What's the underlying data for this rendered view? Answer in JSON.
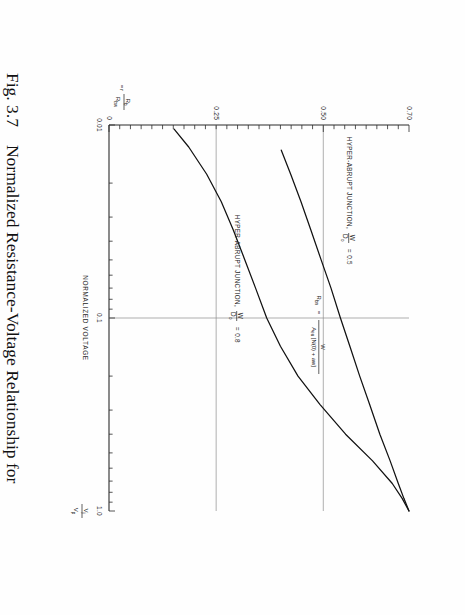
{
  "figure": {
    "number": "Fig. 3.7",
    "caption": "Normalized Resistance-Voltage Relationship for Two-Hyper Abrupt Junctions"
  },
  "axes": {
    "x": {
      "title_main": "NORMALIZED VOLTAGE",
      "symbol_num": "V",
      "symbol_num_sub": "j",
      "symbol_den": "V",
      "symbol_den_sub": "p",
      "scale": "log",
      "ticks": [
        "0.01",
        "0.1",
        "1.0"
      ],
      "min": 0.01,
      "max": 1.0
    },
    "y": {
      "symbol_r": "r",
      "symbol_eq": "=",
      "symbol_num": "R",
      "symbol_num_sub": "b",
      "symbol_den": "R",
      "symbol_den_sub": "bw",
      "ticks": [
        "0.70",
        "0.50",
        "0.25",
        "0"
      ],
      "min": 0,
      "max": 0.7
    }
  },
  "annotations": {
    "formula": {
      "lhs": "R",
      "lhs_sub": "bn",
      "eq": "=",
      "numerator": "W",
      "denominator_a": "A",
      "denominator_b": "eu",
      "denominator_c": "[N(0) + aw]"
    },
    "curve_label_a": {
      "text": "HYPER-ABRUPT JUNCTION,",
      "frac_num": "W",
      "frac_den": "D",
      "frac_den_sub": "o",
      "equals": "= 0.5"
    },
    "curve_label_b": {
      "text": "HYPER-ABRUPT JUNCTION,",
      "frac_num": "W",
      "frac_den": "D",
      "frac_den_sub": "o",
      "equals": "= 0.8"
    }
  },
  "colors": {
    "ink": "#1a1a1a",
    "curve": "#111111",
    "grid": "#8d8d8d",
    "axis": "#2b2b2b",
    "paper": "#fefefe"
  },
  "chart_data": {
    "type": "line",
    "title": "Normalized Resistance-Voltage Relationship for Two-Hyper Abrupt Junctions",
    "xlabel": "NORMALIZED VOLTAGE  Vj/Vp",
    "ylabel": "r = Rb/Rbw",
    "xscale": "log",
    "xlim": [
      0.01,
      1.0
    ],
    "ylim": [
      0,
      0.7
    ],
    "xticks": [
      0.01,
      0.1,
      1.0
    ],
    "yticks": [
      0,
      0.25,
      0.5,
      0.7
    ],
    "grid": true,
    "gridlines_y": [
      0.25,
      0.5
    ],
    "gridlines_x": [
      0.1
    ],
    "legend": "inline-annotations",
    "series": [
      {
        "name": "HYPER-ABRUPT JUNCTION, W/Do = 0.5",
        "x": [
          0.0135,
          0.018,
          0.025,
          0.035,
          0.05,
          0.07,
          0.1,
          0.14,
          0.2,
          0.28,
          0.4,
          0.55,
          0.72,
          0.86,
          1.0
        ],
        "y": [
          0.402,
          0.424,
          0.448,
          0.471,
          0.495,
          0.518,
          0.54,
          0.562,
          0.585,
          0.608,
          0.632,
          0.656,
          0.675,
          0.688,
          0.7
        ]
      },
      {
        "name": "HYPER-ABRUPT JUNCTION, W/Do = 0.8",
        "x": [
          0.0105,
          0.013,
          0.018,
          0.025,
          0.035,
          0.05,
          0.07,
          0.1,
          0.14,
          0.2,
          0.28,
          0.4,
          0.55,
          0.72,
          0.86,
          1.0
        ],
        "y": [
          0.152,
          0.186,
          0.228,
          0.262,
          0.29,
          0.317,
          0.342,
          0.368,
          0.4,
          0.441,
          0.492,
          0.552,
          0.615,
          0.661,
          0.684,
          0.7
        ]
      }
    ]
  }
}
